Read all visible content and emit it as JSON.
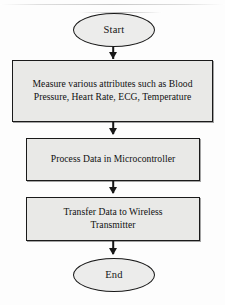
{
  "diagram": {
    "orientation": "top-to-bottom",
    "colors": {
      "node_fill": "#e9e9e7",
      "terminator_fill": "#ececeb",
      "stroke": "#1a1a1a",
      "text": "#101010",
      "background": "#fdfdfd"
    },
    "nodes": [
      {
        "id": "start",
        "shape": "ellipse",
        "label": "Start"
      },
      {
        "id": "measure",
        "shape": "rectangle",
        "label_line_1": "Measure various attributes such as Blood",
        "label_line_2": "Pressure, Heart Rate, ECG, Temperature"
      },
      {
        "id": "process",
        "shape": "rectangle",
        "label": "Process Data in Microcontroller"
      },
      {
        "id": "transfer",
        "shape": "rectangle",
        "label_line_1": "Transfer Data to Wireless",
        "label_line_2": "Transmitter"
      },
      {
        "id": "end",
        "shape": "ellipse",
        "label": "End"
      }
    ],
    "edges": [
      {
        "from": "start",
        "to": "measure",
        "arrow": "down-arrow"
      },
      {
        "from": "measure",
        "to": "process",
        "arrow": "down-arrow"
      },
      {
        "from": "process",
        "to": "transfer",
        "arrow": "down-arrow"
      },
      {
        "from": "transfer",
        "to": "end",
        "arrow": "down-arrow"
      }
    ]
  }
}
